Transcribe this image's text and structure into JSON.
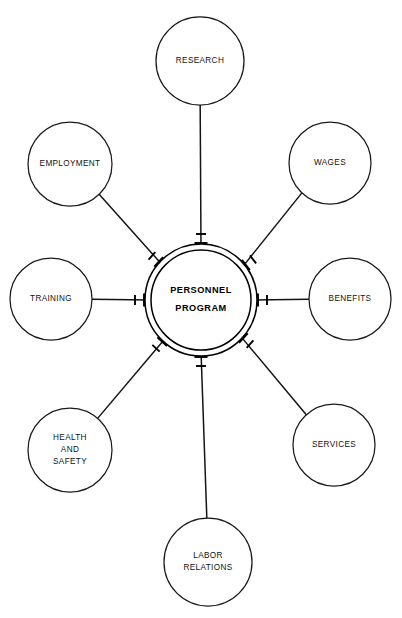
{
  "diagram": {
    "title": "Personnel Program",
    "type": "hub-and-spoke",
    "canvas": {
      "width": 402,
      "height": 618,
      "background": "#ffffff"
    },
    "stroke_color": "#1a1a1a",
    "text_color": "#111111",
    "hub": {
      "name": "personnel-program-hub",
      "label_line1": "PERSONNEL",
      "label_line2": "PROGRAM",
      "center_x": 201,
      "center_y": 300,
      "outer_radius": 56,
      "inner_radius": 50
    },
    "nodes": [
      {
        "id": "research",
        "label_lines": [
          "RESEARCH"
        ],
        "cx": 200,
        "cy": 61,
        "r": 44,
        "angle_deg": 270
      },
      {
        "id": "wages",
        "label_lines": [
          "WAGES"
        ],
        "cx": 330,
        "cy": 163,
        "r": 41,
        "angle_deg": 322
      },
      {
        "id": "benefits",
        "label_lines": [
          "BENEFITS"
        ],
        "cx": 350,
        "cy": 299,
        "r": 41,
        "angle_deg": 0
      },
      {
        "id": "services",
        "label_lines": [
          "SERVICES"
        ],
        "cx": 334,
        "cy": 445,
        "r": 41,
        "angle_deg": 42
      },
      {
        "id": "labor-relations",
        "label_lines": [
          "LABOR",
          "RELATIONS"
        ],
        "cx": 208,
        "cy": 562,
        "r": 44,
        "angle_deg": 90
      },
      {
        "id": "health-and-safety",
        "label_lines": [
          "HEALTH",
          "AND",
          "SAFETY"
        ],
        "cx": 70,
        "cy": 450,
        "r": 42,
        "angle_deg": 133
      },
      {
        "id": "training",
        "label_lines": [
          "TRAINING"
        ],
        "cx": 51,
        "cy": 299,
        "r": 41,
        "angle_deg": 180
      },
      {
        "id": "employment",
        "label_lines": [
          "EMPLOYMENT"
        ],
        "cx": 70,
        "cy": 164,
        "r": 42,
        "angle_deg": 222
      }
    ]
  }
}
